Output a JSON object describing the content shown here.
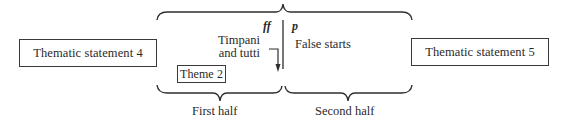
{
  "diagram": {
    "left_box": {
      "label": "Thematic statement 4"
    },
    "right_box": {
      "label": "Thematic statement 5"
    },
    "center": {
      "dynamic_left": "ff",
      "dynamic_right": "p",
      "timpani_line1": "Timpani",
      "timpani_line2": "and tutti",
      "false_starts": "False starts",
      "theme_box": "Theme 2"
    },
    "braces": {
      "first_half_label": "First half",
      "second_half_label": "Second half"
    },
    "colors": {
      "ink": "#2a2a2a",
      "background": "#ffffff"
    }
  }
}
